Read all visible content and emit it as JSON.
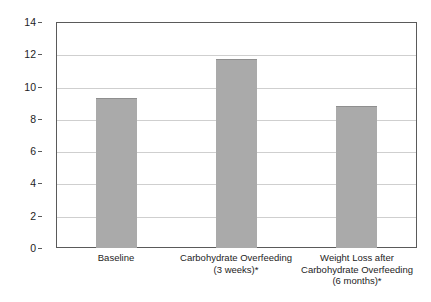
{
  "chart_data": {
    "type": "bar",
    "title": "",
    "subtitle": "",
    "xlabel": "",
    "ylabel": "Liver Fat (%)",
    "ylim": [
      0,
      14
    ],
    "ytick_step": 2,
    "yticks": [
      "14",
      "12",
      "10",
      "8",
      "6",
      "4",
      "2",
      "0"
    ],
    "ytick_values": [
      14,
      12,
      10,
      8,
      6,
      4,
      2,
      0
    ],
    "grid": "horizontal",
    "legend": "none",
    "categories": [
      "Baseline",
      "Carbohydrate Overfeeding (3 weeks)*",
      "Weight Loss after Carbohydrate Overfeeding (6 months)*"
    ],
    "category_lines": [
      [
        "Baseline"
      ],
      [
        "Carbohydrate Overfeeding",
        "(3 weeks)*"
      ],
      [
        "Weight Loss after",
        "Carbohydrate Overfeeding",
        "(6 months)*"
      ]
    ],
    "values": [
      9.3,
      11.7,
      8.8
    ],
    "series": [
      {
        "name": "Liver Fat",
        "values": [
          9.3,
          11.7,
          8.8
        ]
      }
    ],
    "annotations": [
      "* denotes significance marker shown on category label"
    ],
    "colors": {
      "bar_fill": "#aaaaaa",
      "bar_edge": "#8f8f8f",
      "axis": "#5a5a5a",
      "gridline": "#cfcfcf",
      "text": "#1d1d1d",
      "background": "#ffffff"
    }
  }
}
